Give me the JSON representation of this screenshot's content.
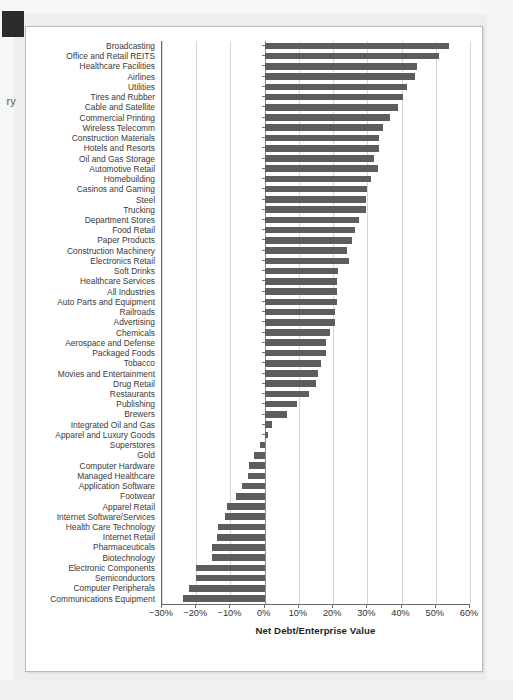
{
  "page": {
    "edge_label": "ry",
    "corner_mark": "page-corner-block"
  },
  "chart_data": {
    "type": "bar",
    "orientation": "horizontal",
    "title": "",
    "subtitle": "",
    "xlabel": "Net Debt/Enterprise Value",
    "ylabel": "",
    "xlim": [
      -30,
      60
    ],
    "xtick_labels": [
      "−30%",
      "−20%",
      "−10%",
      "0%",
      "10%",
      "20%",
      "30%",
      "40%",
      "50%",
      "60%"
    ],
    "xtick_values": [
      -30,
      -20,
      -10,
      0,
      10,
      20,
      30,
      40,
      50,
      60
    ],
    "grid": "vertical",
    "legend": "none",
    "bar_color": "#5d5d5d",
    "unit": "percent",
    "categories": [
      "Broadcasting",
      "Office and Retail REITS",
      "Healthcare Facilities",
      "Airlines",
      "Utilities",
      "Tires and Rubber",
      "Cable and Satellite",
      "Commercial Printing",
      "Wireless Telecomm",
      "Construction Materials",
      "Hotels and Resorts",
      "Oil and Gas Storage",
      "Automotive Retail",
      "Homebuilding",
      "Casinos and Gaming",
      "Steel",
      "Trucking",
      "Department Stores",
      "Food Retail",
      "Paper Products",
      "Construction Machinery",
      "Electronics Retail",
      "Soft Drinks",
      "Healthcare Services",
      "All Industries",
      "Auto Parts and Equipment",
      "Railroads",
      "Advertising",
      "Chemicals",
      "Aerospace and Defense",
      "Packaged Foods",
      "Tobacco",
      "Movies and Entertainment",
      "Drug Retail",
      "Restaurants",
      "Publishing",
      "Brewers",
      "Integrated Oil and Gas",
      "Apparel and Luxury Goods",
      "Superstores",
      "Gold",
      "Computer Hardware",
      "Managed Healthcare",
      "Application Software",
      "Footwear",
      "Apparel Retail",
      "Internet Software/Services",
      "Health Care Technology",
      "Internet Retail",
      "Pharmaceuticals",
      "Biotechnology",
      "Electronic Components",
      "Semiconductors",
      "Computer Peripherals",
      "Communications Equipment"
    ],
    "values": [
      54.0,
      51.0,
      44.5,
      44.0,
      41.5,
      40.5,
      39.0,
      36.5,
      34.5,
      33.5,
      33.5,
      32.0,
      33.0,
      31.0,
      30.0,
      29.5,
      29.5,
      27.5,
      26.5,
      25.5,
      24.0,
      24.5,
      21.5,
      21.0,
      21.0,
      21.0,
      20.5,
      20.5,
      19.0,
      18.0,
      18.0,
      16.5,
      15.5,
      15.0,
      13.0,
      9.5,
      6.5,
      2.0,
      1.0,
      -1.5,
      -3.0,
      -4.5,
      -5.0,
      -6.5,
      -8.5,
      -11.0,
      -11.5,
      -13.5,
      -14.0,
      -15.5,
      -15.5,
      -20.0,
      -20.0,
      -22.0,
      -24.0
    ]
  }
}
